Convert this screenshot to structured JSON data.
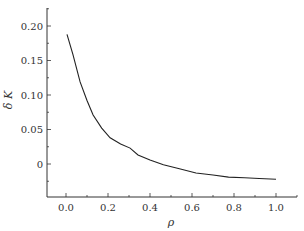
{
  "chart_data": {
    "type": "line",
    "title": "",
    "xlabel": "ρ",
    "ylabel": "δ K",
    "xlim": [
      -0.09,
      1.1
    ],
    "ylim": [
      -0.05,
      0.225
    ],
    "grid": false,
    "legend": null,
    "xticks": [
      0.0,
      0.2,
      0.4,
      0.6,
      0.8,
      1.0
    ],
    "xtick_labels": [
      "0.0",
      "0.2",
      "0.4",
      "0.6",
      "0.8",
      "1.0"
    ],
    "yticks": [
      0,
      0.05,
      0.1,
      0.15,
      0.2
    ],
    "ytick_labels": [
      "0",
      "0.05",
      "0.10",
      "0.15",
      "0.20"
    ],
    "series": [
      {
        "name": "δK(ρ)",
        "color": "#222222",
        "x": [
          0.005,
          0.033,
          0.067,
          0.1,
          0.129,
          0.17,
          0.21,
          0.26,
          0.305,
          0.343,
          0.4,
          0.464,
          0.54,
          0.619,
          0.7,
          0.774,
          0.85,
          0.92,
          1.0
        ],
        "y": [
          0.188,
          0.159,
          0.119,
          0.092,
          0.071,
          0.052,
          0.038,
          0.029,
          0.023,
          0.013,
          0.006,
          -0.001,
          -0.007,
          -0.013,
          -0.016,
          -0.019,
          -0.02,
          -0.021,
          -0.022
        ]
      }
    ]
  }
}
